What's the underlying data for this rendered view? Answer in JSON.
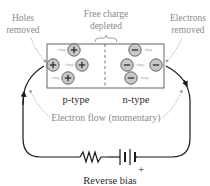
{
  "diagram": {
    "title": "Reverse bias",
    "labels": {
      "holes_removed": [
        "Holes",
        "removed"
      ],
      "free_charge_depleted": [
        "Free charge",
        "depleted"
      ],
      "electrons_removed": [
        "Electrons",
        "removed"
      ],
      "p_type": "p-type",
      "n_type": "n-type",
      "electron_flow": "Electron flow (momentary)",
      "reverse_bias": "Reverse bias",
      "battery_plus": "+"
    },
    "p_region": {
      "carrier_symbol": "+",
      "tiny_label": "-charge",
      "carriers": [
        {
          "cx": 74,
          "cy": 50
        },
        {
          "cx": 53,
          "cy": 65
        },
        {
          "cx": 82,
          "cy": 65
        },
        {
          "cx": 68,
          "cy": 78
        }
      ]
    },
    "n_region": {
      "carrier_symbol": "−",
      "tiny_label": "+charge",
      "carriers": [
        {
          "cx": 135,
          "cy": 50
        },
        {
          "cx": 127,
          "cy": 65
        },
        {
          "cx": 156,
          "cy": 65
        },
        {
          "cx": 131,
          "cy": 78
        }
      ]
    },
    "colors": {
      "wire": "#1a1a1a",
      "box": "#555555",
      "carrier_fill": "#c8c8c8",
      "carrier_stroke": "#555555",
      "gray_text": "#8a8a8a",
      "dark_text": "#2a2a2a"
    }
  }
}
